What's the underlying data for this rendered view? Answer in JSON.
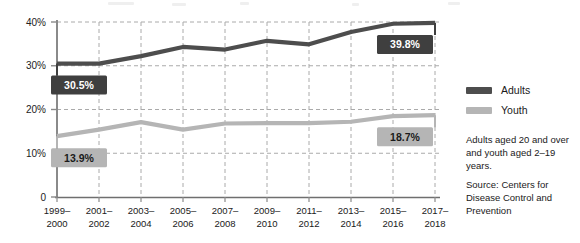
{
  "chart_data": {
    "type": "line",
    "title": "",
    "xlabel": "",
    "ylabel": "",
    "ylim": [
      0,
      40
    ],
    "grid": true,
    "grid_style": "dashed-horizontal-and-vertical",
    "legend_position": "right",
    "categories": [
      "1999–2000",
      "2001–2002",
      "2003–2004",
      "2005–2006",
      "2007–2008",
      "2009–2010",
      "2011–2012",
      "2013–2014",
      "2015–2016",
      "2017–2018"
    ],
    "ytick_labels": [
      "0",
      "10%",
      "20%",
      "30%",
      "40%"
    ],
    "ytick_values": [
      0,
      10,
      20,
      30,
      40
    ],
    "series": [
      {
        "name": "Adults",
        "color": "#4d4d4d",
        "values": [
          30.5,
          30.5,
          32.2,
          34.3,
          33.7,
          35.7,
          34.9,
          37.7,
          39.6,
          39.8
        ]
      },
      {
        "name": "Youth",
        "color": "#b5b5b5",
        "values": [
          13.9,
          15.4,
          17.1,
          15.4,
          16.8,
          16.9,
          16.9,
          17.2,
          18.5,
          18.7
        ]
      }
    ],
    "annotations": [
      {
        "label": "30.5%",
        "series": "Adults",
        "category": "1999–2000",
        "value": 30.5,
        "box_fill": "#3f3f3f",
        "text_color": "#ffffff"
      },
      {
        "label": "39.8%",
        "series": "Adults",
        "category": "2017–2018",
        "value": 39.8,
        "box_fill": "#3f3f3f",
        "text_color": "#ffffff"
      },
      {
        "label": "13.9%",
        "series": "Youth",
        "category": "1999–2000",
        "value": 13.9,
        "box_fill": "#b5b5b5",
        "text_color": "#1a1a1a"
      },
      {
        "label": "18.7%",
        "series": "Youth",
        "category": "2017–2018",
        "value": 18.7,
        "box_fill": "#b5b5b5",
        "text_color": "#1a1a1a"
      }
    ]
  },
  "legend": {
    "items": [
      {
        "label": "Adults",
        "color": "#4d4d4d"
      },
      {
        "label": "Youth",
        "color": "#b5b5b5"
      }
    ]
  },
  "notes": {
    "definition": "Adults aged 20 and over and youth aged 2–19 years.",
    "source": "Source: Centers for Disease Control and Prevention"
  },
  "colors": {
    "adults": "#4d4d4d",
    "youth": "#b5b5b5",
    "axis": "#808080",
    "grid": "#aaaaaa",
    "text": "#1a1a1a",
    "background": "#ffffff"
  }
}
